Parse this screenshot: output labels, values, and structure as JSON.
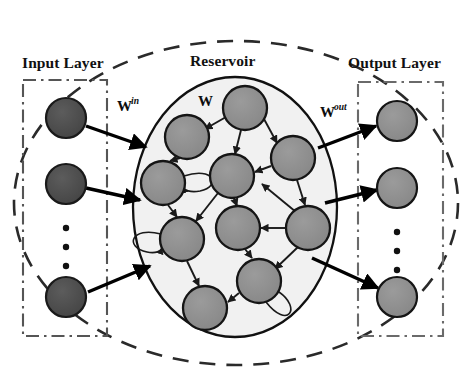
{
  "figure": {
    "type": "echo-state-network-diagram",
    "background_color": "#ffffff",
    "width": 469,
    "height": 389
  },
  "labels": {
    "input_layer": "Input Layer",
    "reservoir": "Reservoir",
    "output_layer": "Output Layer"
  },
  "weights": {
    "input_weight_base": "W",
    "input_weight_sup": "in",
    "recurrent_weight": "W",
    "output_weight_base": "W",
    "output_weight_sup": "out"
  },
  "ellipsis": {
    "glyph": "•",
    "count": 3
  },
  "colors": {
    "input_node_fill": "#4a4a4a",
    "input_node_stroke": "#1a1a1a",
    "reservoir_node_fill": "#8f8f8f",
    "reservoir_node_stroke": "#151515",
    "output_node_fill": "#8f8f8f",
    "output_node_stroke": "#151515",
    "reservoir_ellipse_fill": "#f1f1f1",
    "reservoir_ellipse_stroke": "#111111",
    "outer_dashed_stroke": "#2a2a2a",
    "layer_box_stroke": "#555555",
    "edge_stroke": "#1a1a1a",
    "arrow_stroke": "#000000",
    "text_color": "#111111"
  },
  "input_layer": {
    "box": {
      "x": 23,
      "y": 80,
      "width": 84,
      "height": 256
    },
    "nodes": [
      {
        "id": "i1",
        "cx": 66,
        "cy": 118,
        "r": 20
      },
      {
        "id": "i2",
        "cx": 66,
        "cy": 184,
        "r": 20
      },
      {
        "id": "i3",
        "cx": 66,
        "cy": 297,
        "r": 20
      }
    ],
    "dots": [
      {
        "cx": 66,
        "cy": 228,
        "r": 3.1
      },
      {
        "cx": 66,
        "cy": 247,
        "r": 3.1
      },
      {
        "cx": 66,
        "cy": 266,
        "r": 3.1
      }
    ]
  },
  "output_layer": {
    "box": {
      "x": 358,
      "y": 82,
      "width": 85,
      "height": 254
    },
    "nodes": [
      {
        "id": "o1",
        "cx": 397,
        "cy": 121,
        "r": 20
      },
      {
        "id": "o2",
        "cx": 397,
        "cy": 188,
        "r": 20
      },
      {
        "id": "o3",
        "cx": 397,
        "cy": 297,
        "r": 20
      }
    ],
    "dots": [
      {
        "cx": 397,
        "cy": 232,
        "r": 3.1
      },
      {
        "cx": 397,
        "cy": 251,
        "r": 3.1
      },
      {
        "cx": 397,
        "cy": 270,
        "r": 3.1
      }
    ]
  },
  "reservoir": {
    "outer_dashed_ellipse": {
      "cx": 236,
      "cy": 203,
      "rx": 222,
      "ry": 162
    },
    "inner_ellipse": {
      "cx": 235,
      "cy": 207,
      "rx": 102,
      "ry": 130
    },
    "nodes": [
      {
        "id": "r1",
        "cx": 245,
        "cy": 108,
        "r": 22
      },
      {
        "id": "r2",
        "cx": 187,
        "cy": 137,
        "r": 22
      },
      {
        "id": "r3",
        "cx": 163,
        "cy": 183,
        "r": 22
      },
      {
        "id": "r4",
        "cx": 232,
        "cy": 176,
        "r": 22
      },
      {
        "id": "r5",
        "cx": 293,
        "cy": 158,
        "r": 22
      },
      {
        "id": "r6",
        "cx": 182,
        "cy": 239,
        "r": 22
      },
      {
        "id": "r7",
        "cx": 238,
        "cy": 228,
        "r": 22
      },
      {
        "id": "r8",
        "cx": 308,
        "cy": 228,
        "r": 22
      },
      {
        "id": "r9",
        "cx": 259,
        "cy": 281,
        "r": 22
      },
      {
        "id": "r10",
        "cx": 205,
        "cy": 308,
        "r": 22
      }
    ],
    "edges": [
      {
        "from": "r1",
        "to": "r2",
        "arrow": true
      },
      {
        "from": "r1",
        "to": "r4",
        "arrow": true
      },
      {
        "from": "r1",
        "to": "r5",
        "arrow": true
      },
      {
        "from": "r2",
        "to": "r3",
        "arrow": true
      },
      {
        "from": "r3",
        "to": "r6",
        "arrow": true
      },
      {
        "from": "r5",
        "to": "r4",
        "arrow": true
      },
      {
        "from": "r5",
        "to": "r8",
        "arrow": true
      },
      {
        "from": "r4",
        "to": "r6",
        "arrow": true
      },
      {
        "from": "r4",
        "to": "r7",
        "arrow": true
      },
      {
        "from": "r8",
        "to": "r7",
        "arrow": true
      },
      {
        "from": "r7",
        "to": "r9",
        "arrow": true
      },
      {
        "from": "r8",
        "to": "r9",
        "arrow": true
      },
      {
        "from": "r6",
        "to": "r10",
        "arrow": true
      },
      {
        "from": "r9",
        "to": "r10",
        "arrow": true
      }
    ],
    "self_loops": [
      {
        "node": "r3",
        "side": "right"
      },
      {
        "node": "r6",
        "side": "left"
      },
      {
        "node": "r9",
        "side": "bottom"
      }
    ]
  },
  "input_connections": [
    {
      "from": "i1",
      "to_point": [
        146,
        146
      ],
      "arrow": true
    },
    {
      "from": "i2",
      "to_point": [
        140,
        200
      ],
      "arrow": true
    },
    {
      "from": "i3",
      "to_point": [
        148,
        265
      ],
      "arrow": true
    }
  ],
  "output_connections": [
    {
      "from_point": [
        320,
        140
      ],
      "to": "o1",
      "arrow": true
    },
    {
      "from_point": [
        327,
        196
      ],
      "to": "o2",
      "arrow": true
    },
    {
      "from_point": [
        318,
        268
      ],
      "to": "o3",
      "arrow": true
    }
  ],
  "label_positions": {
    "input_layer": {
      "x": 22,
      "y": 68
    },
    "reservoir": {
      "x": 190,
      "y": 66
    },
    "output_layer": {
      "x": 348,
      "y": 68
    },
    "w_in": {
      "x": 117,
      "y": 111
    },
    "w": {
      "x": 198,
      "y": 106
    },
    "w_out": {
      "x": 320,
      "y": 117
    }
  }
}
